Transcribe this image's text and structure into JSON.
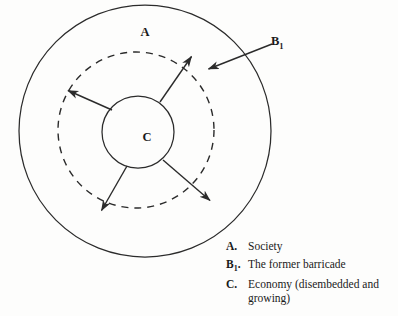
{
  "figure": {
    "type": "concentric-circle-diagram",
    "labels": {
      "outer": "A",
      "barricade_key": "B",
      "barricade_subscript": "1",
      "inner": "C"
    }
  },
  "legend": {
    "items": [
      {
        "key": "A.",
        "key_base": "A",
        "key_sub": "",
        "text": "Society"
      },
      {
        "key": "B1.",
        "key_base": "B",
        "key_sub": "1",
        "text": "The former barricade"
      },
      {
        "key": "C.",
        "key_base": "C",
        "key_sub": "",
        "text": "Economy (disembedded and growing)"
      }
    ]
  },
  "geometry": {
    "outer_circle": {
      "cx": 145,
      "cy": 131,
      "r": 126
    },
    "dashed_circle": {
      "cx": 136,
      "cy": 130,
      "r": 78
    },
    "inner_circle": {
      "cx": 138,
      "cy": 132,
      "r": 36
    },
    "arrows": [
      {
        "name": "arrow-upper-left",
        "x1": 112,
        "y1": 110,
        "x2": 66,
        "y2": 89
      },
      {
        "name": "arrow-upper-right",
        "x1": 160,
        "y1": 102,
        "x2": 193,
        "y2": 54
      },
      {
        "name": "arrow-lower-right",
        "x1": 163,
        "y1": 160,
        "x2": 212,
        "y2": 203
      },
      {
        "name": "arrow-lower-left",
        "x1": 127,
        "y1": 166,
        "x2": 100,
        "y2": 213
      },
      {
        "name": "arrow-barricade-pointer",
        "x1": 272,
        "y1": 44,
        "x2": 206,
        "y2": 70
      }
    ]
  },
  "colors": {
    "ink": "#2b2b2b",
    "background": "#fdfdfc"
  }
}
